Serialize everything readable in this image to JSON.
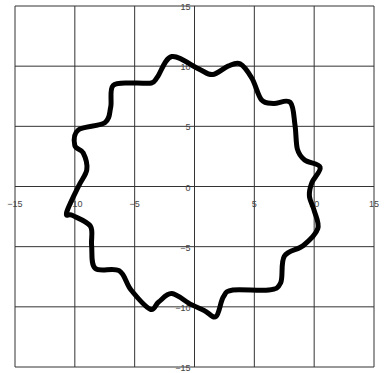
{
  "chart_data": {
    "type": "line",
    "title": "",
    "xlabel": "",
    "ylabel": "",
    "xlim": [
      -15,
      15
    ],
    "ylim": [
      -15,
      15
    ],
    "grid": true,
    "legend": null,
    "x_ticks": [
      -15,
      -10,
      -5,
      0,
      5,
      10,
      15
    ],
    "y_ticks": [
      -15,
      -10,
      -5,
      0,
      5,
      10,
      15
    ],
    "x_tick_labels": [
      "-15",
      "-10",
      "-5",
      "0",
      "5",
      "10",
      "15"
    ],
    "y_tick_labels": [
      "-15",
      "-10",
      "-5",
      "0",
      "5",
      "10",
      "15"
    ],
    "series": [
      {
        "name": "closed curve",
        "color": "#000000",
        "points": [
          [
            -1.9,
            10.8
          ],
          [
            0.3,
            9.8
          ],
          [
            1.5,
            9.3
          ],
          [
            2.8,
            10.0
          ],
          [
            3.8,
            10.2
          ],
          [
            4.8,
            9.0
          ],
          [
            5.6,
            7.2
          ],
          [
            6.6,
            6.9
          ],
          [
            8.0,
            7.0
          ],
          [
            8.4,
            5.1
          ],
          [
            8.6,
            3.1
          ],
          [
            9.2,
            2.2
          ],
          [
            10.5,
            1.6
          ],
          [
            9.8,
            0.3
          ],
          [
            9.6,
            -0.8
          ],
          [
            10.0,
            -2.0
          ],
          [
            10.3,
            -3.5
          ],
          [
            9.1,
            -4.9
          ],
          [
            7.5,
            -5.8
          ],
          [
            7.2,
            -8.0
          ],
          [
            6.2,
            -8.6
          ],
          [
            3.2,
            -8.6
          ],
          [
            2.4,
            -9.2
          ],
          [
            1.8,
            -10.8
          ],
          [
            0.8,
            -10.3
          ],
          [
            -0.3,
            -9.8
          ],
          [
            -1.9,
            -8.9
          ],
          [
            -3.0,
            -9.6
          ],
          [
            -3.7,
            -10.2
          ],
          [
            -5.3,
            -8.6
          ],
          [
            -6.3,
            -7.0
          ],
          [
            -8.3,
            -6.8
          ],
          [
            -8.6,
            -4.9
          ],
          [
            -8.7,
            -3.3
          ],
          [
            -10.2,
            -2.4
          ],
          [
            -10.7,
            -2.2
          ],
          [
            -9.7,
            0.0
          ],
          [
            -9.0,
            1.4
          ],
          [
            -9.3,
            2.8
          ],
          [
            -10.0,
            3.4
          ],
          [
            -9.7,
            4.7
          ],
          [
            -7.5,
            5.3
          ],
          [
            -7.0,
            6.6
          ],
          [
            -6.8,
            8.4
          ],
          [
            -5.0,
            8.6
          ],
          [
            -3.6,
            8.6
          ],
          [
            -3.1,
            9.1
          ],
          [
            -1.9,
            10.8
          ]
        ]
      }
    ]
  }
}
